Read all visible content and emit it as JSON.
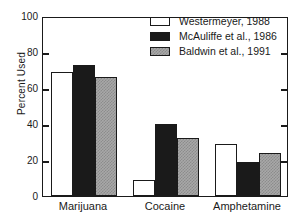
{
  "chart_data": {
    "type": "bar",
    "title": "",
    "xlabel": "",
    "ylabel": "Percent Used",
    "ylim": [
      0,
      100
    ],
    "yticks": [
      0,
      20,
      40,
      60,
      80,
      100
    ],
    "ytick_labels": [
      "0",
      "20",
      "40",
      "60",
      "80",
      "100"
    ],
    "grid": false,
    "legend_position": "top-right",
    "categories": [
      "Marijuana",
      "Cocaine",
      "Amphetamine"
    ],
    "series": [
      {
        "name": "Westermeyer, 1988",
        "swatch": "white",
        "color": "#ffffff",
        "values": [
          69,
          9,
          29
        ]
      },
      {
        "name": "McAuliffe et al., 1986",
        "swatch": "black",
        "color": "#1a1a1a",
        "values": [
          73,
          40,
          19
        ]
      },
      {
        "name": "Baldwin et al., 1991",
        "swatch": "gray",
        "color": "#a8a8a8",
        "values": [
          66,
          32,
          24
        ]
      }
    ]
  },
  "axes": {
    "y_title": "Percent Used",
    "frame_color": "#1a1a1a"
  }
}
